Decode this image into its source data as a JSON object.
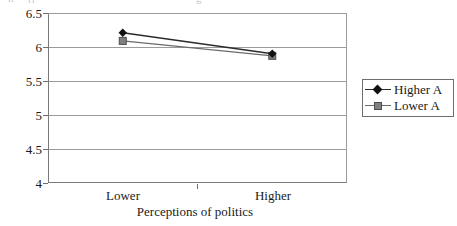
{
  "artifacts": {
    "cutoff_fragments": [
      "n",
      "ri",
      "g"
    ]
  },
  "chart_data": {
    "type": "line",
    "title": "",
    "xlabel": "Perceptions of politics",
    "ylabel": "OCBO",
    "categories": [
      "Lower",
      "Higher"
    ],
    "ylim": [
      4,
      6.5
    ],
    "yticks": [
      "6.5",
      "6",
      "5.5",
      "5",
      "4.5",
      "4"
    ],
    "ytick_values": [
      6.5,
      6,
      5.5,
      5,
      4.5,
      4
    ],
    "grid": true,
    "grid_axis": "y",
    "legend_position": "right",
    "series": [
      {
        "name": "Higher A",
        "values": [
          6.21,
          5.9
        ],
        "marker": "diamond",
        "marker_color": "#111111",
        "line_color": "#2b2b2b"
      },
      {
        "name": "Lower A",
        "values": [
          6.09,
          5.87
        ],
        "marker": "square",
        "marker_color": "#808080",
        "line_color": "#6b6b6b"
      }
    ]
  },
  "legend": {
    "items": [
      {
        "label": "Higher A"
      },
      {
        "label": "Lower A"
      }
    ]
  },
  "colors": {
    "axis": "#7a7a7a",
    "grid": "#9b9b9b",
    "series_a": "#111111",
    "series_b": "#808080",
    "background": "#ffffff"
  }
}
